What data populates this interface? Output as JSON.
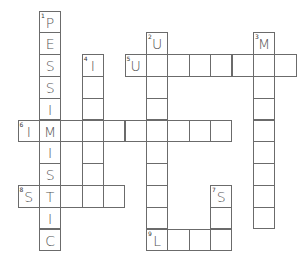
{
  "puzzle": {
    "type": "crossword",
    "grid_origin": {
      "x": 18,
      "y": 11
    },
    "cell_size": {
      "w": 21.4,
      "h": 21.8
    },
    "colors": {
      "border": "#6b6b6b",
      "letter": "#555555",
      "background": "#ffffff"
    },
    "words": [
      {
        "number": 1,
        "direction": "down",
        "row": 0,
        "col": 1,
        "length": 11,
        "letters": "PESSIMISTIC"
      },
      {
        "number": 2,
        "direction": "down",
        "row": 1,
        "col": 6,
        "length": 10,
        "letters": "U"
      },
      {
        "number": 3,
        "direction": "down",
        "row": 1,
        "col": 11,
        "length": 9,
        "letters": "M"
      },
      {
        "number": 4,
        "direction": "down",
        "row": 2,
        "col": 3,
        "length": 7,
        "letters": "I"
      },
      {
        "number": 5,
        "direction": "across",
        "row": 2,
        "col": 5,
        "length": 8,
        "letters": "U"
      },
      {
        "number": 6,
        "direction": "across",
        "row": 5,
        "col": 0,
        "length": 10,
        "letters": "IM"
      },
      {
        "number": 7,
        "direction": "down",
        "row": 8,
        "col": 9,
        "length": 3,
        "letters": "S"
      },
      {
        "number": 8,
        "direction": "across",
        "row": 8,
        "col": 0,
        "length": 5,
        "letters": "SI"
      },
      {
        "number": 9,
        "direction": "across",
        "row": 10,
        "col": 6,
        "length": 4,
        "letters": "L"
      }
    ]
  }
}
